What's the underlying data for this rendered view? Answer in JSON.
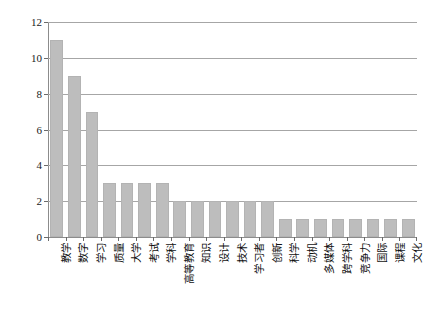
{
  "chart_data": {
    "type": "bar",
    "title": "",
    "subtitle": "",
    "xlabel": "",
    "ylabel": "",
    "ylim": [
      0,
      12
    ],
    "ytick_values": [
      0,
      2,
      4,
      6,
      8,
      10,
      12
    ],
    "ytick_labels": [
      "0",
      "2",
      "4",
      "6",
      "8",
      "10",
      "12"
    ],
    "grid": true,
    "legend": false,
    "legend_position": "none",
    "orientation": "vertical",
    "bar_color": "#bdbdbd",
    "bar_edge_color": "#b3b3b3",
    "gridline_color": "#a6a6a6",
    "categories": [
      "教学",
      "数字",
      "学习",
      "质量",
      "大学",
      "考试",
      "学科",
      "高等教育",
      "知识",
      "设计",
      "技术",
      "学习者",
      "创新",
      "科学",
      "动机",
      "多媒体",
      "跨学科",
      "竞争力",
      "国际",
      "课程",
      "文化"
    ],
    "values": [
      11,
      9,
      7,
      3,
      3,
      3,
      3,
      2,
      2,
      2,
      2,
      2,
      2,
      1,
      1,
      1,
      1,
      1,
      1,
      1,
      1
    ]
  }
}
